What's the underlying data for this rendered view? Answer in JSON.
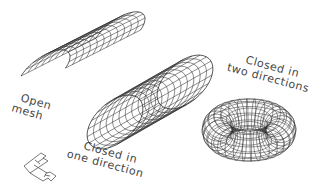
{
  "diagram": {
    "background": "#ffffff",
    "line_color": "#2e2e2e",
    "label_color": "#444444",
    "shapes": [
      {
        "id": "open-mesh",
        "type": "half-cylinder",
        "label_lines": [
          "Open",
          "mesh"
        ]
      },
      {
        "id": "cylinder",
        "type": "cylinder",
        "label_lines": [
          "Closed in",
          "one direction"
        ]
      },
      {
        "id": "torus",
        "type": "torus",
        "label_lines": [
          "Closed in",
          "two directions"
        ]
      }
    ],
    "labels": {
      "open_line1": "Open",
      "open_line2": "mesh",
      "cyl_line1": "Closed in",
      "cyl_line2": "one direction",
      "torus_line1": "Closed in",
      "torus_line2": "two directions"
    },
    "ucs_icon": "ucs-icon"
  }
}
